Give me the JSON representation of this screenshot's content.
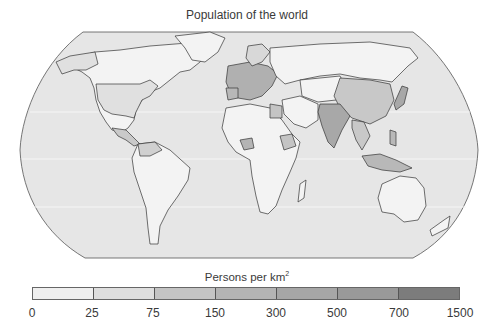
{
  "title": "Population of the world",
  "legend": {
    "title": "Persons per km",
    "title_sup": "2",
    "bins": [
      {
        "from": "0",
        "to": "25",
        "color": "#efefef"
      },
      {
        "from": "25",
        "to": "75",
        "color": "#dedede"
      },
      {
        "from": "75",
        "to": "150",
        "color": "#c4c4c4"
      },
      {
        "from": "150",
        "to": "300",
        "color": "#b4b4b4"
      },
      {
        "from": "300",
        "to": "500",
        "color": "#a6a6a6"
      },
      {
        "from": "500",
        "to": "700",
        "color": "#999999"
      },
      {
        "from": "700",
        "to": "1500",
        "color": "#7c7c7c"
      }
    ],
    "ticks": [
      "0",
      "25",
      "75",
      "150",
      "300",
      "500",
      "700",
      "1500"
    ]
  },
  "colors": {
    "ocean": "#e6e6e6",
    "land_low": "#f3f3f3",
    "land_mid": "#c9c9c9",
    "land_high": "#a8a8a8",
    "border": "#333333"
  }
}
